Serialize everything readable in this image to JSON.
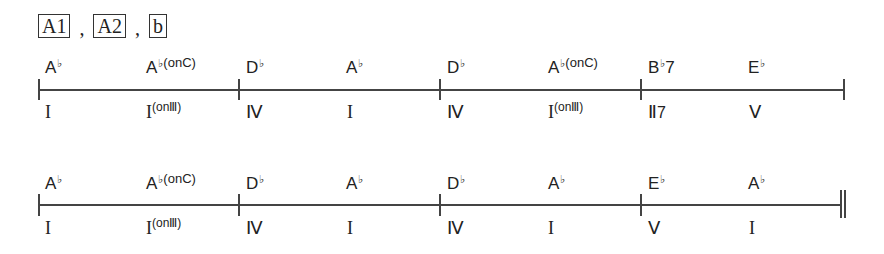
{
  "sections": {
    "labels": [
      "A1",
      "A2",
      "b"
    ],
    "separator": ","
  },
  "lines": [
    {
      "measures": [
        {
          "beats": [
            {
              "chord": "A",
              "acc": "♭",
              "ext": "",
              "roman": "I",
              "roman_sup": ""
            },
            {
              "chord": "A",
              "acc": "♭",
              "ext": "(onC)",
              "roman": "I",
              "roman_sup": "(onⅢ)"
            }
          ]
        },
        {
          "beats": [
            {
              "chord": "D",
              "acc": "♭",
              "ext": "",
              "roman": "Ⅳ",
              "roman_sup": ""
            },
            {
              "chord": "A",
              "acc": "♭",
              "ext": "",
              "roman": "I",
              "roman_sup": ""
            }
          ]
        },
        {
          "beats": [
            {
              "chord": "D",
              "acc": "♭",
              "ext": "",
              "roman": "Ⅳ",
              "roman_sup": ""
            },
            {
              "chord": "A",
              "acc": "♭",
              "ext": "(onC)",
              "roman": "I",
              "roman_sup": "(onⅢ)"
            }
          ]
        },
        {
          "beats": [
            {
              "chord": "B",
              "acc": "♭",
              "ext": "7",
              "roman": "Ⅱ",
              "roman_sup": "7"
            },
            {
              "chord": "E",
              "acc": "♭",
              "ext": "",
              "roman": "Ⅴ",
              "roman_sup": ""
            }
          ]
        }
      ],
      "end_barline": "single"
    },
    {
      "measures": [
        {
          "beats": [
            {
              "chord": "A",
              "acc": "♭",
              "ext": "",
              "roman": "I",
              "roman_sup": ""
            },
            {
              "chord": "A",
              "acc": "♭",
              "ext": "(onC)",
              "roman": "I",
              "roman_sup": "(onⅢ)"
            }
          ]
        },
        {
          "beats": [
            {
              "chord": "D",
              "acc": "♭",
              "ext": "",
              "roman": "Ⅳ",
              "roman_sup": ""
            },
            {
              "chord": "A",
              "acc": "♭",
              "ext": "",
              "roman": "I",
              "roman_sup": ""
            }
          ]
        },
        {
          "beats": [
            {
              "chord": "D",
              "acc": "♭",
              "ext": "",
              "roman": "Ⅳ",
              "roman_sup": ""
            },
            {
              "chord": "A",
              "acc": "♭",
              "ext": "",
              "roman": "I",
              "roman_sup": ""
            }
          ]
        },
        {
          "beats": [
            {
              "chord": "E",
              "acc": "♭",
              "ext": "",
              "roman": "Ⅴ",
              "roman_sup": ""
            },
            {
              "chord": "A",
              "acc": "♭",
              "ext": "",
              "roman": "I",
              "roman_sup": ""
            }
          ]
        }
      ],
      "end_barline": "double"
    }
  ]
}
